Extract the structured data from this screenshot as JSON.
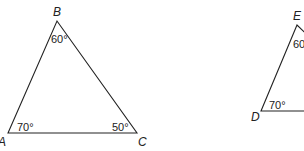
{
  "diagram": {
    "triangles": [
      {
        "name": "ABC",
        "vertices": [
          {
            "label": "A",
            "angle": "70°"
          },
          {
            "label": "B",
            "angle": "60°"
          },
          {
            "label": "C",
            "angle": "50°"
          }
        ]
      },
      {
        "name": "DEF",
        "vertices": [
          {
            "label": "D",
            "angle": "70°"
          },
          {
            "label": "E",
            "angle": "60°"
          }
        ]
      }
    ],
    "stroke_color": "#222222"
  }
}
